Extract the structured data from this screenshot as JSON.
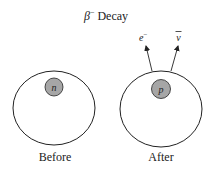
{
  "title": {
    "symbol": "β",
    "superscript": "−",
    "text": "Decay"
  },
  "before": {
    "label": "Before",
    "particle": "n"
  },
  "after": {
    "label": "After",
    "particle": "p",
    "emitted": [
      {
        "symbol": "e",
        "superscript": "−"
      },
      {
        "symbol": "ν"
      }
    ]
  },
  "colors": {
    "stroke": "#222222",
    "particle_fill": "#a6a6a6",
    "background": "#ffffff"
  }
}
